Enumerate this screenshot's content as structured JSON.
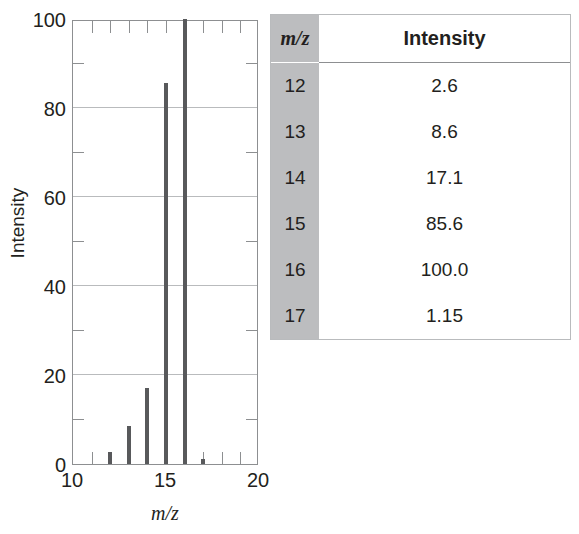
{
  "chart_data": {
    "type": "bar",
    "title": "",
    "xlabel": "m/z",
    "ylabel": "Intensity",
    "xlim": [
      10,
      20
    ],
    "ylim": [
      0,
      100
    ],
    "xticks": [
      10,
      15,
      20
    ],
    "yticks": [
      0,
      20,
      40,
      60,
      80,
      100
    ],
    "y_minor_ticks": [
      10,
      30,
      50,
      70,
      90
    ],
    "grid": "horizontal-major",
    "legend": "none",
    "categories": [
      12,
      13,
      14,
      15,
      16,
      17
    ],
    "values": [
      2.6,
      8.6,
      17.1,
      85.6,
      100.0,
      1.15
    ],
    "x": [
      12,
      13,
      14,
      15,
      16,
      17
    ],
    "y": [
      2.6,
      8.6,
      17.1,
      85.6,
      100.0,
      1.15
    ]
  },
  "axis": {
    "y_title": "Intensity",
    "x_title": "m/z",
    "y_tick_labels": [
      "100",
      "80",
      "60",
      "40",
      "20",
      "0"
    ],
    "x_tick_labels": [
      "10",
      "15",
      "20"
    ]
  },
  "table": {
    "headers": [
      "m/z",
      "Intensity"
    ],
    "rows": [
      {
        "mz": "12",
        "intensity": "2.6"
      },
      {
        "mz": "13",
        "intensity": "8.6"
      },
      {
        "mz": "14",
        "intensity": "17.1"
      },
      {
        "mz": "15",
        "intensity": "85.6"
      },
      {
        "mz": "16",
        "intensity": "100.0"
      },
      {
        "mz": "17",
        "intensity": "1.15"
      }
    ]
  },
  "colors": {
    "bar": "#58595b",
    "frame": "#8d8f91",
    "gridline": "#b9bbbd",
    "table_header_col": "#bcbdbf",
    "table_border": "#b9bbbd",
    "text": "#231f20"
  }
}
